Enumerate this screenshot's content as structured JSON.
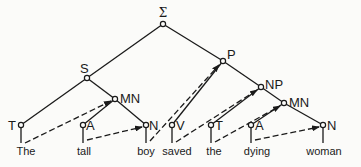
{
  "diagram": {
    "type": "syntax-tree",
    "nodes": {
      "root": {
        "label": "Σ"
      },
      "S": {
        "label": "S"
      },
      "P": {
        "label": "P"
      },
      "NP": {
        "label": "NP"
      },
      "MN_left": {
        "label": "MN"
      },
      "MN_right": {
        "label": "MN"
      },
      "T_left": {
        "label": "T"
      },
      "A_left": {
        "label": "A"
      },
      "N_left": {
        "label": "N"
      },
      "V": {
        "label": "V"
      },
      "T_right": {
        "label": "T"
      },
      "A_right": {
        "label": "A"
      },
      "N_right": {
        "label": "N"
      }
    },
    "words": [
      "The",
      "tall",
      "boy",
      "saved",
      "the",
      "dying",
      "woman"
    ],
    "edges_solid": [
      [
        "root",
        "S"
      ],
      [
        "root",
        "P"
      ],
      [
        "S",
        "T_left"
      ],
      [
        "S",
        "MN_left"
      ],
      [
        "MN_left",
        "A_left"
      ],
      [
        "MN_left",
        "N_left"
      ],
      [
        "P",
        "V"
      ],
      [
        "P",
        "NP"
      ],
      [
        "NP",
        "T_right"
      ],
      [
        "NP",
        "MN_right"
      ],
      [
        "MN_right",
        "A_right"
      ],
      [
        "MN_right",
        "N_right"
      ]
    ],
    "edges_dashed_arrows": [
      [
        "The",
        "MN_left"
      ],
      [
        "tall",
        "N_left"
      ],
      [
        "boy",
        "P"
      ],
      [
        "saved",
        "NP"
      ],
      [
        "the",
        "MN_right"
      ],
      [
        "dying",
        "N_right"
      ]
    ],
    "colors": {
      "line": "#1a1a1a",
      "background": "#fbfbf9"
    }
  }
}
